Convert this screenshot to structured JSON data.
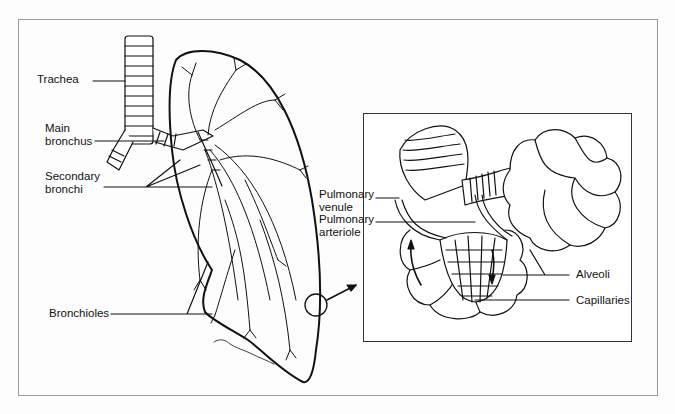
{
  "diagram": {
    "left_panel": {
      "labels": [
        {
          "id": "trachea",
          "text": "Trachea"
        },
        {
          "id": "main_bronchus",
          "text": "Main\nbronchus"
        },
        {
          "id": "secondary_bronchi",
          "text": "Secondary\nbronchi"
        },
        {
          "id": "bronchioles",
          "text": "Bronchioles"
        }
      ],
      "signature": "Stephanie 91"
    },
    "inset_panel": {
      "labels": [
        {
          "id": "pulmonary_venule",
          "text": "Pulmonary\nvenule"
        },
        {
          "id": "pulmonary_arteriole",
          "text": "Pulmonary\narteriole"
        },
        {
          "id": "alveoli",
          "text": "Alveoli"
        },
        {
          "id": "capillaries",
          "text": "Capillaries"
        }
      ]
    },
    "colors": {
      "line": "#111111",
      "frame": "#9a9a9a",
      "background": "#fdfdfd"
    }
  }
}
